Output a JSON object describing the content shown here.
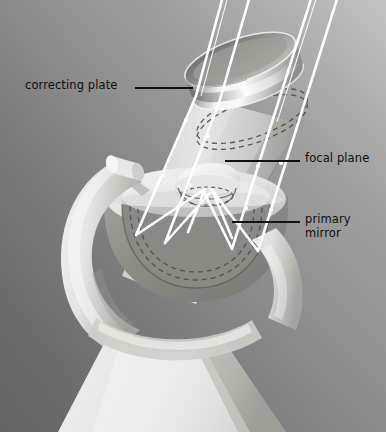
{
  "figure": {
    "kind": "schematic-illustration",
    "width": 386,
    "height": 432,
    "background": {
      "top_right": "#b9b9b9",
      "mid": "#8a8a8a",
      "bottom_left": "#6e6e6e",
      "bottom_right": "#6a6a6a"
    },
    "palette": {
      "ray": "#ffffff",
      "leader_line": "#101010",
      "label_text": "#101010",
      "body_light": "#eceae6",
      "body_mid": "#d2d0cb",
      "body_shadow": "#a8a6a2",
      "tube_light": "#dedcd7",
      "tube_shade": "#b6b4af",
      "mirror_dark": "#8f8d88",
      "mirror_face": "#c9c7c2",
      "ring_bright": "#f2f1ee",
      "ring_dark": "#8e8c87",
      "dashed": "#55534f"
    }
  },
  "labels": [
    {
      "id": "correcting-plate",
      "text": "correcting plate",
      "lines": [
        "correcting plate"
      ],
      "x": 25,
      "y": 78,
      "align": "left",
      "leader": {
        "x1": 135,
        "y1": 88,
        "x2": 193,
        "y2": 88
      }
    },
    {
      "id": "focal-plane",
      "text": "focal plane",
      "lines": [
        "focal plane"
      ],
      "x": 305,
      "y": 151,
      "align": "left",
      "leader": {
        "x1": 225,
        "y1": 161,
        "x2": 300,
        "y2": 161
      }
    },
    {
      "id": "primary-mirror",
      "text": "primary mirror",
      "lines": [
        "primary",
        "mirror"
      ],
      "line1": "primary",
      "line2": "mirror",
      "x": 305,
      "y": 212,
      "align": "left",
      "leader": {
        "x1": 232,
        "y1": 222,
        "x2": 300,
        "y2": 222
      }
    }
  ],
  "light_rays": {
    "color": "#ffffff",
    "count": 4,
    "entry_points_top": [
      223,
      250,
      312,
      338
    ],
    "description": "parallel starlight entering aperture, refracted by the correcting plate, reflected from the primary mirror, converging on the curved focal plane"
  },
  "components": [
    {
      "name": "correcting-plate",
      "shape": "tilted-ring",
      "cx": 250,
      "cy": 85
    },
    {
      "name": "telescope-tube",
      "shape": "tilted-cylinder"
    },
    {
      "name": "focal-plane",
      "shape": "small-dome",
      "cx": 205,
      "cy": 178
    },
    {
      "name": "primary-mirror",
      "shape": "concave-bowl",
      "cx": 196,
      "cy": 238
    },
    {
      "name": "fork-mount",
      "shape": "curved-fork-arm"
    },
    {
      "name": "pivot-axle",
      "shape": "cylinder",
      "cx": 128,
      "cy": 168
    },
    {
      "name": "pedestal-base",
      "shape": "tapered-column"
    }
  ]
}
